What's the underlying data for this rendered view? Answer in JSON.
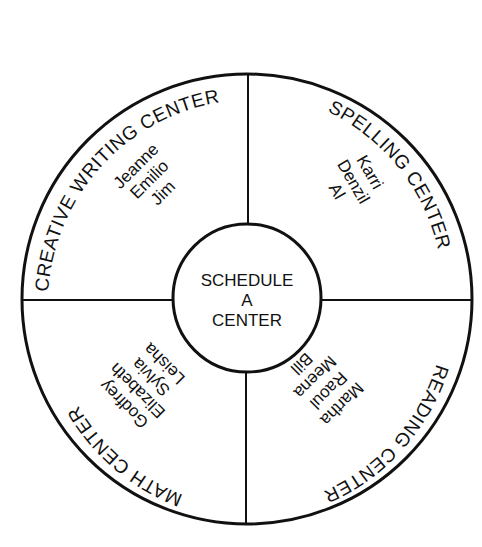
{
  "diagram": {
    "type": "schedule-wheel",
    "hub": {
      "lines": [
        "SCHEDULE",
        "A",
        "CENTER"
      ]
    },
    "quadrants": [
      {
        "position": "top-left",
        "label": "CREATIVE WRITING CENTER",
        "names": [
          "Jeanne",
          "Emilio",
          "Jim"
        ]
      },
      {
        "position": "top-right",
        "label": "SPELLING CENTER",
        "names": [
          "Karri",
          "Denzil",
          "Al"
        ]
      },
      {
        "position": "bottom-right",
        "label": "READING CENTER",
        "names": [
          "Martha",
          "Raoul",
          "Meena",
          "Bill"
        ]
      },
      {
        "position": "bottom-left",
        "label": "MATH CENTER",
        "names": [
          "Godfrey",
          "Elizabeth",
          "Sylvia",
          "Leisha"
        ]
      }
    ],
    "colors": {
      "stroke": "#111111",
      "background": "#ffffff"
    }
  }
}
